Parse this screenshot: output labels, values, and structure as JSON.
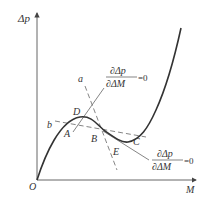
{
  "diagram": {
    "type": "curve-sketch",
    "axes": {
      "y_label": "Δp",
      "x_label": "M",
      "origin_label": "O"
    },
    "points": {
      "A": "A",
      "B": "B",
      "C": "C",
      "D": "D",
      "E": "E"
    },
    "lines": {
      "a": "a",
      "b": "b"
    },
    "annotations": {
      "upper": {
        "numerator": "∂Δp",
        "denominator": "∂ΔM",
        "equals": "=0"
      },
      "lower": {
        "numerator": "∂Δp",
        "denominator": "∂ΔM",
        "equals": "=0"
      }
    },
    "colors": {
      "curve": "#333333",
      "axis": "#555555",
      "dashed": "#666666",
      "background": "#ffffff"
    }
  }
}
